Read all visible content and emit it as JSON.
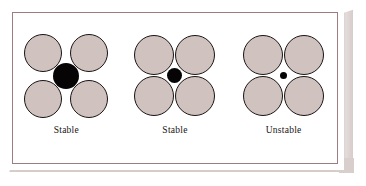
{
  "figure": {
    "background_color": "#ffffff",
    "card_color": "#ffffff",
    "frame_line_color": "#9e7d80",
    "shadow_color": "#d8cfcd",
    "sphere_fill_color": "#cfc2bf",
    "sphere_outline_color": "#1a1414",
    "core_color": "#060404"
  },
  "groups": [
    {
      "id": "group-1",
      "label": "Stable",
      "core_diameter_px": 26,
      "sphere_diameter_px": 38,
      "spheres_touch_each_other": false,
      "description": "Large central black ion forces the four gray spheres apart; anions do not contact each other."
    },
    {
      "id": "group-2",
      "label": "Stable",
      "core_diameter_px": 15,
      "sphere_diameter_px": 40,
      "spheres_touch_each_other": true,
      "description": "Central black ion exactly fits the interstice; gray spheres just touch one another."
    },
    {
      "id": "group-3",
      "label": "Unstable",
      "core_diameter_px": 7,
      "sphere_diameter_px": 40,
      "spheres_touch_each_other": true,
      "description": "Central black ion is too small to keep the gray spheres apart, so the arrangement collapses."
    }
  ]
}
